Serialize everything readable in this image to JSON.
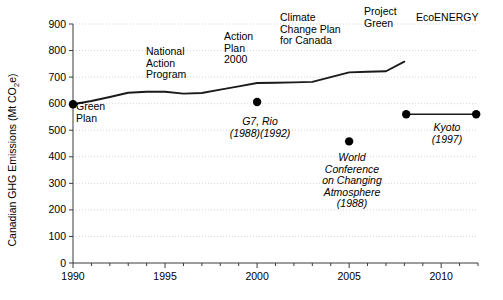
{
  "chart_data": {
    "type": "line",
    "title": "",
    "xlabel": "",
    "ylabel": "Canadian GHG Emissions (Mt CO₂e)",
    "ylabel_main": "Canadian GHG Emissions (Mt CO",
    "ylabel_sub": "2",
    "ylabel_tail": "e)",
    "xlim": [
      1990,
      2012
    ],
    "ylim": [
      0,
      900
    ],
    "grid": true,
    "legend": "none",
    "y_ticks": [
      0,
      100,
      200,
      300,
      400,
      500,
      600,
      700,
      800,
      900
    ],
    "y_tick_labels": [
      "0",
      "100",
      "200",
      "300",
      "400",
      "500",
      "600",
      "700",
      "800",
      "900"
    ],
    "x_ticks": [
      1990,
      1995,
      2000,
      2005,
      2010
    ],
    "x_tick_labels": [
      "1990",
      "1995",
      "2000",
      "2005",
      "2010"
    ],
    "x_minor_ticks": [
      1991,
      1992,
      1993,
      1994,
      1996,
      1997,
      1998,
      1999,
      2001,
      2002,
      2003,
      2004,
      2006,
      2007,
      2008,
      2009,
      2011,
      2012
    ],
    "series": [
      {
        "name": "Canadian GHG Emissions",
        "x": [
          1990,
          1991,
          1992,
          1993,
          1994,
          1995,
          1996,
          1997,
          1998,
          1999,
          2000,
          2001,
          2002,
          2003,
          2004,
          2005,
          2006,
          2007,
          2008
        ],
        "values": [
          598,
          610,
          625,
          641,
          645,
          645,
          638,
          640,
          653,
          665,
          678,
          679,
          680,
          682,
          700,
          718,
          720,
          722,
          758
        ]
      }
    ],
    "markers": [
      {
        "name": "g7-rio-marker",
        "x": 2000.0,
        "y": 606
      },
      {
        "name": "world-conference-marker",
        "x": 2005.0,
        "y": 458
      },
      {
        "name": "kyoto-start-marker",
        "x": 2008.1,
        "y": 560
      },
      {
        "name": "kyoto-end-marker",
        "x": 2011.9,
        "y": 560
      }
    ],
    "kyoto_segment": {
      "x_start": 2008.1,
      "x_end": 2011.9,
      "y": 560
    }
  },
  "annotations": {
    "policy_labels": [
      {
        "name": "annotation-green-plan",
        "text": "Green\nPlan",
        "style": "plain",
        "align": "left"
      },
      {
        "name": "annotation-national-action-program",
        "text": "National\nAction\nProgram",
        "style": "plain",
        "align": "left"
      },
      {
        "name": "annotation-action-plan-2000",
        "text": "Action\nPlan\n2000",
        "style": "plain",
        "align": "left"
      },
      {
        "name": "annotation-climate-change-plan",
        "text": "Climate\nChange Plan\nfor Canada",
        "style": "plain",
        "align": "left"
      },
      {
        "name": "annotation-project-green",
        "text": "Project\nGreen",
        "style": "plain",
        "align": "left"
      },
      {
        "name": "annotation-ecoenergy",
        "text": "EcoENERGY",
        "style": "plain",
        "align": "left"
      }
    ],
    "event_labels": [
      {
        "name": "annotation-g7-rio",
        "text": "G7, Rio\n(1988)(1992)",
        "style": "italic",
        "align": "center"
      },
      {
        "name": "annotation-world-conference",
        "text": "World\nConference\non Changing\nAtmosphere\n(1988)",
        "style": "italic",
        "align": "center"
      },
      {
        "name": "annotation-kyoto",
        "text": "Kyoto\n(1997)",
        "style": "italic",
        "align": "center"
      }
    ]
  },
  "colors": {
    "background": "#ffffff",
    "line": "#1a1a1a",
    "marker": "#000000",
    "axis": "#3a3a3a",
    "grid": "#c9c9c9",
    "text": "#000000"
  }
}
